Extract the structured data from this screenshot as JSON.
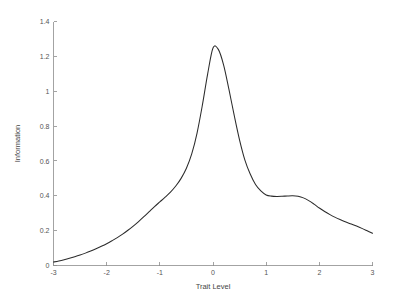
{
  "chart_data": {
    "type": "line",
    "title": "",
    "xlabel": "Trait Level",
    "ylabel": "Information",
    "xlim": [
      -3,
      3
    ],
    "ylim": [
      0,
      1.4
    ],
    "grid": false,
    "legend": null,
    "xticks": [
      -3,
      -2,
      -1,
      0,
      1,
      2,
      3
    ],
    "xtick_labels": [
      "-3",
      "-2",
      "-1",
      "0",
      "1",
      "2",
      "3"
    ],
    "yticks": [
      0,
      0.2,
      0.4,
      0.6,
      0.8,
      1,
      1.2,
      1.4
    ],
    "ytick_labels": [
      "0",
      "0.2",
      "0.4",
      "0.6",
      "0.8",
      "1",
      "1.2",
      "1.4"
    ],
    "line_color": "#2b2b2b",
    "series": [
      {
        "name": "Test Information Function",
        "x": [
          -3.0,
          -2.9,
          -2.8,
          -2.7,
          -2.6,
          -2.5,
          -2.4,
          -2.3,
          -2.2,
          -2.1,
          -2.0,
          -1.9,
          -1.8,
          -1.7,
          -1.6,
          -1.5,
          -1.4,
          -1.3,
          -1.2,
          -1.1,
          -1.0,
          -0.9,
          -0.8,
          -0.7,
          -0.6,
          -0.5,
          -0.4,
          -0.3,
          -0.2,
          -0.1,
          0.0,
          0.1,
          0.2,
          0.3,
          0.4,
          0.5,
          0.6,
          0.7,
          0.8,
          0.9,
          1.0,
          1.1,
          1.2,
          1.3,
          1.4,
          1.5,
          1.6,
          1.7,
          1.8,
          1.9,
          2.0,
          2.1,
          2.2,
          2.3,
          2.4,
          2.5,
          2.6,
          2.7,
          2.8,
          2.9,
          3.0
        ],
        "y": [
          0.02,
          0.026,
          0.033,
          0.041,
          0.05,
          0.06,
          0.071,
          0.083,
          0.096,
          0.11,
          0.125,
          0.142,
          0.16,
          0.18,
          0.202,
          0.226,
          0.252,
          0.28,
          0.309,
          0.338,
          0.365,
          0.392,
          0.421,
          0.456,
          0.5,
          0.558,
          0.64,
          0.76,
          0.92,
          1.1,
          1.248,
          1.24,
          1.15,
          1.01,
          0.86,
          0.72,
          0.605,
          0.525,
          0.465,
          0.428,
          0.405,
          0.398,
          0.396,
          0.397,
          0.399,
          0.4,
          0.397,
          0.388,
          0.372,
          0.352,
          0.33,
          0.31,
          0.292,
          0.276,
          0.262,
          0.249,
          0.238,
          0.226,
          0.213,
          0.199,
          0.185
        ]
      }
    ]
  },
  "axes": {
    "x_axis_title": "Trait Level",
    "y_axis_title": "Information"
  }
}
